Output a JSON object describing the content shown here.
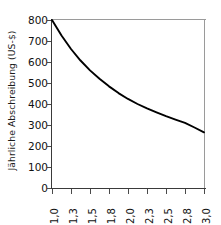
{
  "chart_data": {
    "type": "line",
    "title": "",
    "xlabel": "",
    "ylabel": "Jährliche Abschreibung (US-$)",
    "x_tick_labels": [
      "1,0",
      "1,3",
      "1,5",
      "1,8",
      "2,0",
      "2,3",
      "2,5",
      "2,8",
      "3,0"
    ],
    "y_tick_labels": [
      "0",
      "100",
      "200",
      "300",
      "400",
      "500",
      "600",
      "700",
      "800"
    ],
    "xlim": [
      1.0,
      3.0
    ],
    "ylim": [
      0,
      800
    ],
    "grid": false,
    "legend": "none",
    "series": [
      {
        "name": "Jährliche Abschreibung",
        "color": "#000000",
        "x": [
          1.0,
          1.125,
          1.25,
          1.375,
          1.5,
          1.625,
          1.75,
          1.875,
          2.0,
          2.125,
          2.25,
          2.375,
          2.5,
          2.625,
          2.75,
          2.875,
          3.0
        ],
        "values": [
          800,
          726,
          662,
          607,
          560,
          520,
          484,
          452,
          424,
          400,
          379,
          360,
          342,
          326,
          310,
          288,
          265
        ]
      }
    ],
    "annotations": []
  },
  "axes": {
    "y_title": "Jährliche Abschreibung (US-$)",
    "y_ticks": [
      {
        "label": "800",
        "value": 800
      },
      {
        "label": "700",
        "value": 700
      },
      {
        "label": "600",
        "value": 600
      },
      {
        "label": "500",
        "value": 500
      },
      {
        "label": "400",
        "value": 400
      },
      {
        "label": "300",
        "value": 300
      },
      {
        "label": "200",
        "value": 200
      },
      {
        "label": "100",
        "value": 100
      },
      {
        "label": "0",
        "value": 0
      }
    ],
    "x_ticks": [
      {
        "label": "1,0",
        "value": 1.0
      },
      {
        "label": "1,3",
        "value": 1.25
      },
      {
        "label": "1,5",
        "value": 1.5
      },
      {
        "label": "1,8",
        "value": 1.75
      },
      {
        "label": "2,0",
        "value": 2.0
      },
      {
        "label": "2,3",
        "value": 2.25
      },
      {
        "label": "2,5",
        "value": 2.5
      },
      {
        "label": "2,8",
        "value": 2.75
      },
      {
        "label": "3,0",
        "value": 3.0
      }
    ]
  },
  "colors": {
    "curve": "#000000",
    "axis": "#3a3a3a",
    "frame": "#9a9a9a",
    "background": "#ffffff",
    "text": "#111111"
  }
}
